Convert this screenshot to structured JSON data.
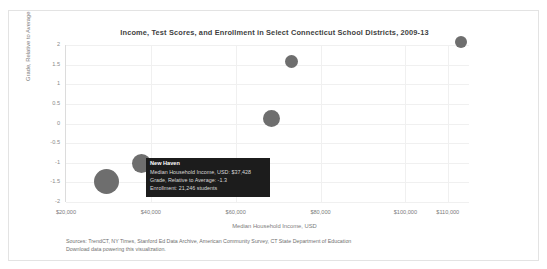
{
  "chart_data": {
    "type": "scatter",
    "title": "Income, Test Scores, and Enrollment in Select Connecticut School Districts, 2009-13",
    "xlabel": "Median Household Income, USD",
    "ylabel": "Grade, Relative to Average",
    "xlim": [
      20000,
      115000
    ],
    "ylim": [
      -2,
      2
    ],
    "xticks": [
      "$20,000",
      "$40,000",
      "$60,000",
      "$80,000",
      "$100,000",
      "$110,000"
    ],
    "xtick_values": [
      20000,
      40000,
      60000,
      80000,
      100000,
      110000
    ],
    "yticks": [
      "2",
      "1.5",
      "1",
      "0.5",
      "0",
      "-0.5",
      "-1",
      "-1.5",
      "-2"
    ],
    "ytick_values": [
      2,
      1.5,
      1,
      0.5,
      0,
      -0.5,
      -1,
      -1.5,
      -2
    ],
    "grid": true,
    "legend": "none",
    "size_encodes": "Enrollment",
    "bubble_color": "#6e6e6e",
    "points": [
      {
        "name": "New Haven",
        "x": 37428,
        "y": -1.3,
        "enrollment": 21246,
        "r": 12.5,
        "px": 105,
        "py": 180
      },
      {
        "name": "District B",
        "x": 45000,
        "y": -0.95,
        "enrollment": 11000,
        "r": 9.5,
        "px": 140,
        "py": 162
      },
      {
        "name": "District C",
        "x": 72000,
        "y": 0.0,
        "enrollment": 8200,
        "r": 8.5,
        "px": 270,
        "py": 117
      },
      {
        "name": "District D",
        "x": 76500,
        "y": 1.55,
        "enrollment": 4600,
        "r": 6.5,
        "px": 290,
        "py": 60
      },
      {
        "name": "District E",
        "x": 105500,
        "y": 1.95,
        "enrollment": 4200,
        "r": 6.0,
        "px": 460,
        "py": 41
      }
    ]
  },
  "tooltip": {
    "title": "New Haven",
    "rows": [
      "Median Household Income, USD: $37,428",
      "Grade, Relative to Average: -1.3",
      "Enrollment: 21,246 students"
    ]
  },
  "footer": {
    "sources": "Sources: TrendCT, NY Times, Stanford Ed Data Archive, American Community Survey, CT State Department of Education",
    "download": "Download data powering this visualization."
  }
}
